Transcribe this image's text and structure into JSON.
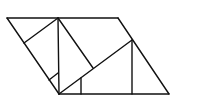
{
  "diagram": {
    "stroke_color": "#111111",
    "background": "#ffffff",
    "segments": [
      {
        "id": "top-edge",
        "x1": 7,
        "y1": 18,
        "x2": 118,
        "y2": 18
      },
      {
        "id": "bottom-edge",
        "x1": 59,
        "y1": 94,
        "x2": 169,
        "y2": 94
      },
      {
        "id": "left-slant",
        "x1": 7,
        "y1": 18,
        "x2": 59,
        "y2": 94
      },
      {
        "id": "right-slant",
        "x1": 118,
        "y1": 18,
        "x2": 169,
        "y2": 94
      },
      {
        "id": "inner-vertical-left",
        "x1": 58,
        "y1": 18,
        "x2": 59,
        "y2": 94
      },
      {
        "id": "perpendicular-to-left-slant",
        "x1": 58,
        "y1": 18,
        "x2": 24,
        "y2": 43
      },
      {
        "id": "small-right-angle-mark",
        "x1": 49,
        "y1": 80,
        "x2": 58,
        "y2": 73
      },
      {
        "id": "inner-diagonal-down",
        "x1": 58,
        "y1": 18,
        "x2": 93,
        "y2": 68
      },
      {
        "id": "long-diagonal",
        "x1": 59,
        "y1": 94,
        "x2": 132,
        "y2": 40
      },
      {
        "id": "inner-vertical-right",
        "x1": 132,
        "y1": 40,
        "x2": 132,
        "y2": 94
      },
      {
        "id": "short-vertical",
        "x1": 81,
        "y1": 78,
        "x2": 81,
        "y2": 94
      }
    ]
  }
}
